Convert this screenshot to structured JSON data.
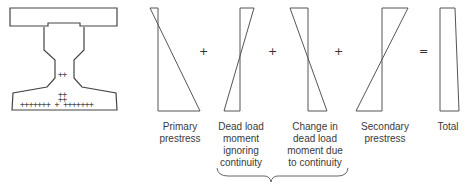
{
  "figure": {
    "cross_section": {
      "name": "bridge-girder-cross-section",
      "strands_web": "++",
      "strands_mid": [
        "++",
        "++"
      ],
      "strands_bottom_row": "+++++++ + +++++++"
    },
    "operators": [
      "+",
      "+",
      "+",
      "="
    ],
    "diagrams": [
      {
        "id": "primary",
        "label_lines": [
          "Primary",
          "prestress"
        ]
      },
      {
        "id": "dead-load",
        "label_lines": [
          "Dead load",
          "moment",
          "ignoring",
          "continuity"
        ]
      },
      {
        "id": "change-dead-load",
        "label_lines": [
          "Change in",
          "dead load",
          "moment due",
          "to continuity"
        ]
      },
      {
        "id": "secondary",
        "label_lines": [
          "Secondary",
          "prestress"
        ]
      },
      {
        "id": "total",
        "label_lines": [
          "Total"
        ]
      }
    ],
    "colors": {
      "stroke": "#555555",
      "text": "#3a3a3a"
    }
  }
}
